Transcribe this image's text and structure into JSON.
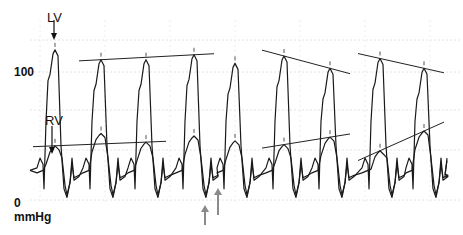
{
  "chart_data": {
    "type": "line",
    "title": "",
    "xlabel": "",
    "ylabel": "mmHg",
    "ylim": [
      0,
      130
    ],
    "y_ticks": [
      {
        "value": 100,
        "label": "100"
      },
      {
        "value": 0,
        "label": "0"
      }
    ],
    "y_unit_label": "mmHg",
    "grid": true,
    "annotations": {
      "lv_label": "LV",
      "rv_label": "RV",
      "up_arrows_count": 2
    },
    "series": [
      {
        "name": "LV",
        "beats_peak_mmHg": [
          118,
          110,
          110,
          114,
          107,
          113,
          103,
          111,
          103
        ],
        "beats_x": [
          1,
          2,
          3,
          4,
          5,
          6,
          7,
          8,
          9
        ]
      },
      {
        "name": "RV",
        "beats_peak_mmHg": [
          40,
          50,
          43,
          48,
          44,
          41,
          47,
          36,
          52
        ],
        "beats_x": [
          1,
          2,
          3,
          4,
          5,
          6,
          7,
          8,
          9
        ]
      }
    ],
    "trend_lines": [
      {
        "series": "LV",
        "from_beat": 2,
        "to_beat": 4,
        "direction": "rising"
      },
      {
        "series": "LV",
        "from_beat": 6,
        "to_beat": 7,
        "direction": "falling"
      },
      {
        "series": "LV",
        "from_beat": 8,
        "to_beat": 9,
        "direction": "falling"
      },
      {
        "series": "RV",
        "from_beat": 1,
        "to_beat": 3,
        "direction": "falling"
      },
      {
        "series": "RV",
        "from_beat": 6,
        "to_beat": 7,
        "direction": "rising"
      },
      {
        "series": "RV",
        "from_beat": 8,
        "to_beat": 9,
        "direction": "rising"
      }
    ]
  }
}
